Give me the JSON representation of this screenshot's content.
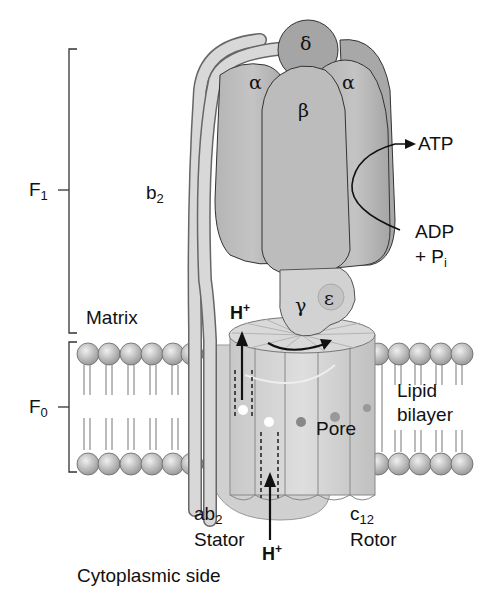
{
  "diagram": {
    "brackets": {
      "f1": {
        "label": "F",
        "sub": "1"
      },
      "f0": {
        "label": "F",
        "sub": "0"
      }
    },
    "subunits": {
      "delta": "δ",
      "alpha_left": "α",
      "alpha_right": "α",
      "beta": "β",
      "gamma": "γ",
      "epsilon": "ε",
      "b2": {
        "label": "b",
        "sub": "2"
      },
      "ab2": {
        "label": "ab",
        "sub": "2"
      },
      "stator": "Stator",
      "c12": {
        "label": "c",
        "sub": "12"
      },
      "rotor": "Rotor",
      "pore": "Pore"
    },
    "labels": {
      "atp": "ATP",
      "adp": "ADP",
      "pi": {
        "prefix": "+ P",
        "sub": "i"
      },
      "matrix": "Matrix",
      "lipid": "Lipid",
      "bilayer": "bilayer",
      "cytoplasmic": "Cytoplasmic side",
      "h_top": {
        "label": "H",
        "sup": "+"
      },
      "h_bottom": {
        "label": "H",
        "sup": "+"
      }
    },
    "colors": {
      "protein": "#a9a9a9",
      "protein_light": "#cfcfcf",
      "stalk": "#d6d6d6",
      "lipid_head": "#bdbdbd",
      "outline": "#333333"
    }
  }
}
